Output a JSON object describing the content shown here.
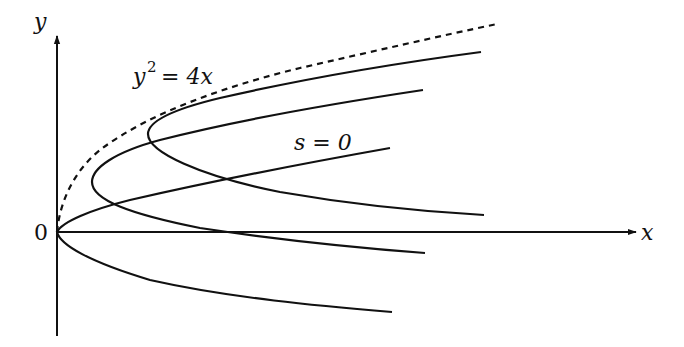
{
  "diagram": {
    "axes": {
      "x_label": "x",
      "y_label": "y",
      "origin_label": "0"
    },
    "envelope": {
      "label_base": "y",
      "label_exp": "2",
      "label_rest": " = 4x",
      "style": "dashed"
    },
    "curves": [
      {
        "name": "parabola-s0",
        "label": "s = 0",
        "vertex": [
          0,
          0
        ]
      },
      {
        "name": "parabola-s1",
        "label": "",
        "vertex": [
          1,
          2
        ]
      },
      {
        "name": "parabola-s2",
        "label": "",
        "vertex": [
          2.6,
          3.2
        ]
      }
    ],
    "colors": {
      "stroke": "#111111",
      "background": "#ffffff"
    }
  }
}
